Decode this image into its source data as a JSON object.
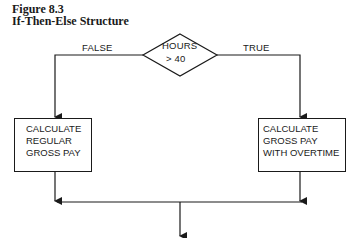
{
  "figure": {
    "number": "Figure 8.3",
    "title": "If-Then-Else Structure"
  },
  "decision": {
    "line1": "HOURS",
    "line2": "> 40"
  },
  "branches": {
    "false_label": "FALSE",
    "true_label": "TRUE"
  },
  "false_box": {
    "lines": [
      "CALCULATE",
      "REGULAR",
      "GROSS PAY"
    ]
  },
  "true_box": {
    "lines": [
      "CALCULATE",
      "GROSS PAY",
      "WITH OVERTIME"
    ]
  },
  "colors": {
    "line": "#1a1a1a",
    "background": "#ffffff"
  }
}
